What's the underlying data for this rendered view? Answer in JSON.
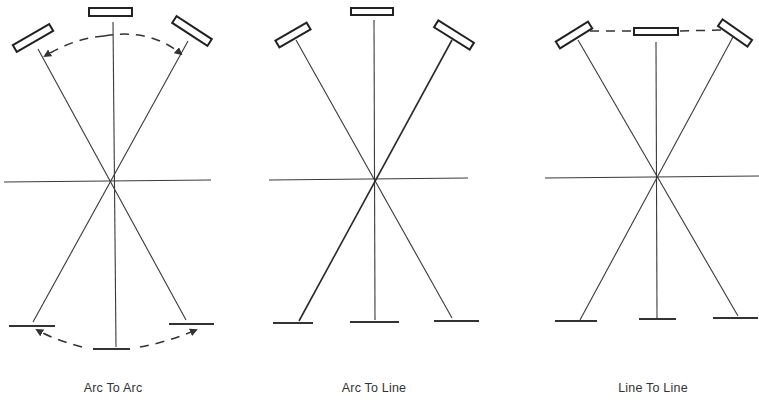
{
  "figure": {
    "panels": [
      {
        "id": "arc-to-arc",
        "caption": "Arc To Arc",
        "top_mirror_arrangement": "arc",
        "bottom_plate_arrangement": "arc",
        "top_connector": "dashed-arc-with-arrows",
        "bottom_connector": "dashed-arc-with-arrows"
      },
      {
        "id": "arc-to-line",
        "caption": "Arc To Line",
        "top_mirror_arrangement": "arc",
        "bottom_plate_arrangement": "line",
        "top_connector": "none",
        "bottom_connector": "none"
      },
      {
        "id": "line-to-line",
        "caption": "Line To Line",
        "top_mirror_arrangement": "line",
        "bottom_plate_arrangement": "line",
        "top_connector": "dashed-line",
        "bottom_connector": "none"
      }
    ],
    "colors": {
      "background": "#ffffff",
      "ink": "#333333"
    }
  }
}
